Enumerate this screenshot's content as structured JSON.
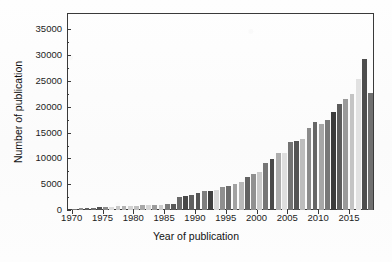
{
  "figure": {
    "background_color": "#fdfdfd",
    "frame_color": "#3a3a3a"
  },
  "axis_titles": {
    "x": "Year of publication",
    "y": "Number of publication"
  },
  "chart_data": {
    "type": "bar",
    "title": "",
    "xlabel": "Year of publication",
    "ylabel": "Number of publication",
    "xlim": [
      1969.4,
      2018.9
    ],
    "ylim": [
      0,
      38000
    ],
    "grid": false,
    "legend": null,
    "y_ticks": [
      0,
      5000,
      10000,
      15000,
      20000,
      25000,
      30000,
      35000
    ],
    "y_tick_labels": [
      "0",
      "5000",
      "10000",
      "15000",
      "20000",
      "25000",
      "30000",
      "35000"
    ],
    "x_ticks": [
      1970,
      1975,
      1980,
      1985,
      1990,
      1995,
      2000,
      2005,
      2010,
      2015
    ],
    "x_tick_labels": [
      "1970",
      "1975",
      "1980",
      "1985",
      "1990",
      "1995",
      "2000",
      "2005",
      "2010",
      "2015"
    ],
    "categories": [
      1970,
      1971,
      1972,
      1973,
      1974,
      1975,
      1976,
      1977,
      1978,
      1979,
      1980,
      1981,
      1982,
      1983,
      1984,
      1985,
      1986,
      1987,
      1988,
      1989,
      1990,
      1991,
      1992,
      1993,
      1994,
      1995,
      1996,
      1997,
      1998,
      1999,
      2000,
      2001,
      2002,
      2003,
      2004,
      2005,
      2006,
      2007,
      2008,
      2009,
      2010,
      2011,
      2012,
      2013,
      2014,
      2015,
      2016,
      2017,
      2018
    ],
    "values": [
      260,
      300,
      420,
      470,
      500,
      560,
      620,
      700,
      760,
      820,
      870,
      900,
      950,
      1000,
      1060,
      1100,
      1150,
      2550,
      2800,
      3000,
      3250,
      3700,
      3750,
      3800,
      4550,
      4750,
      5000,
      5450,
      6450,
      7000,
      7350,
      9150,
      9850,
      11150,
      11000,
      13200,
      13450,
      13850,
      15900,
      17100,
      16650,
      17500,
      18950,
      20600,
      21500,
      22400,
      25400,
      29350,
      22700
    ],
    "bar_shades": [
      "#7a7a7a",
      "#8d8d8d",
      "#5f5f5f",
      "#6e6e6e",
      "#505050",
      "#8a8a8a",
      "#dcdcdc",
      "#c8c8c8",
      "#b4b4b4",
      "#d2d2d2",
      "#c0c0c0",
      "#a8a8a8",
      "#d6d6d6",
      "#9c9c9c",
      "#cccccc",
      "#7c7c7c",
      "#5a5a5a",
      "#6a6a6a",
      "#484848",
      "#606060",
      "#555555",
      "#7e7e7e",
      "#3f3f3f",
      "#d8d8d8",
      "#8f8f8f",
      "#6c6c6c",
      "#a2a2a2",
      "#b8b8b8",
      "#636363",
      "#909090",
      "#cacaca",
      "#767676",
      "#4a4a4a",
      "#adadad",
      "#dedede",
      "#737373",
      "#545454",
      "#bdbdbd",
      "#8b8b8b",
      "#666666",
      "#a6a6a6",
      "#787878",
      "#3c3c3c",
      "#5c5c5c",
      "#9a9a9a",
      "#c4c4c4",
      "#e2e2e2",
      "#4e4e4e",
      "#707070"
    ],
    "peak": {
      "year": 2017,
      "value": 36500
    },
    "last": {
      "year": 2018,
      "value": 22700
    }
  }
}
